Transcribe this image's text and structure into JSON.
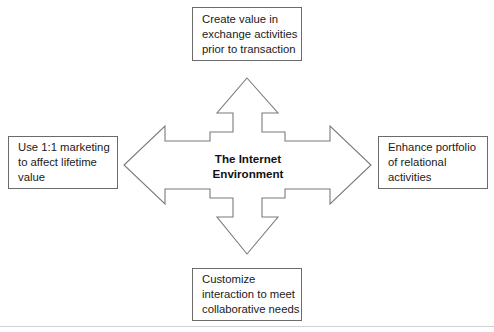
{
  "diagram": {
    "center": {
      "label_line_1": "The Internet",
      "label_line_2": "Environment"
    },
    "nodes": {
      "top": {
        "line_1": "Create value in",
        "line_2": "exchange activities",
        "line_3": "prior to transaction"
      },
      "left": {
        "line_1": "Use 1:1 marketing",
        "line_2": "to affect lifetime",
        "line_3": "value"
      },
      "right": {
        "line_1": "Enhance portfolio",
        "line_2": "of relational",
        "line_3": "activities"
      },
      "bottom": {
        "line_1": "Customize",
        "line_2": "interaction to meet",
        "line_3": "collaborative needs"
      }
    },
    "colors": {
      "stroke": "#6b6b6b",
      "arrow_stroke": "#7a7a7a",
      "text": "#1a1a1a",
      "background": "#ffffff",
      "rule": "#d2d2d6"
    }
  }
}
